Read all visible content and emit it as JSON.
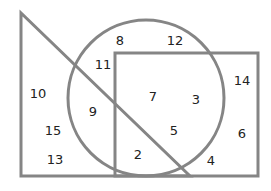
{
  "colors": {
    "stroke": "#858585",
    "text": "#222222",
    "background": "#ffffff"
  },
  "shapes": {
    "triangle": {
      "points": "21,13 21,176 190,176"
    },
    "circle": {
      "cx": 146,
      "cy": 98,
      "r": 78
    },
    "rectangle": {
      "x": 115,
      "y": 53,
      "w": 143,
      "h": 123
    }
  },
  "labels": [
    {
      "text": "8",
      "x": 120,
      "y": 40
    },
    {
      "text": "12",
      "x": 175,
      "y": 40
    },
    {
      "text": "11",
      "x": 103,
      "y": 64
    },
    {
      "text": "14",
      "x": 242,
      "y": 80
    },
    {
      "text": "10",
      "x": 38,
      "y": 93
    },
    {
      "text": "7",
      "x": 153,
      "y": 96
    },
    {
      "text": "3",
      "x": 196,
      "y": 99
    },
    {
      "text": "9",
      "x": 93,
      "y": 111
    },
    {
      "text": "15",
      "x": 53,
      "y": 130
    },
    {
      "text": "5",
      "x": 174,
      "y": 130
    },
    {
      "text": "6",
      "x": 242,
      "y": 133
    },
    {
      "text": "2",
      "x": 138,
      "y": 154
    },
    {
      "text": "13",
      "x": 55,
      "y": 159
    },
    {
      "text": "4",
      "x": 211,
      "y": 160
    }
  ]
}
